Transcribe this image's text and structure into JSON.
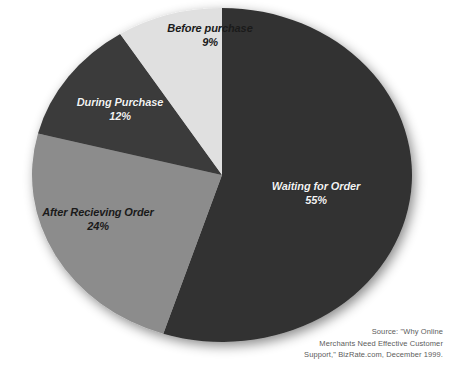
{
  "chart_data": {
    "type": "pie",
    "title": "",
    "subtitle": "",
    "xlabel": "",
    "ylabel": "",
    "legend_position": "none",
    "labels_inside": true,
    "categories": [
      "Waiting for Order",
      "After Recieving Order",
      "During Purchase",
      "Before purchase"
    ],
    "values": [
      55,
      24,
      12,
      9
    ],
    "value_labels": [
      "55%",
      "24%",
      "12%",
      "9%"
    ],
    "units": "percent",
    "total": 100,
    "slices": [
      {
        "name": "Waiting for Order",
        "value": 55,
        "value_label": "55%",
        "color": "#333333",
        "label_color": "#f2f2f2"
      },
      {
        "name": "After Recieving Order",
        "value": 24,
        "value_label": "24%",
        "color": "#8c8c8c",
        "label_color": "#1a1a1a"
      },
      {
        "name": "During Purchase",
        "value": 12,
        "value_label": "12%",
        "color": "#3a3a3a",
        "label_color": "#f2f2f2"
      },
      {
        "name": "Before purchase",
        "value": 9,
        "value_label": "9%",
        "color": "#e0e0e0",
        "label_color": "#1a1a1a"
      }
    ]
  },
  "labels": {
    "before": {
      "name": "Before purchase",
      "value": "9%"
    },
    "during": {
      "name": "During Purchase",
      "value": "12%"
    },
    "after": {
      "name": "After Recieving Order",
      "value": "24%"
    },
    "waiting": {
      "name": "Waiting for Order",
      "value": "55%"
    }
  },
  "source": {
    "line1": "Source: \"Why Online",
    "line2": "Merchants Need Effective Customer",
    "line3": "Support,\" BizRate.com, December 1999."
  },
  "colors": {
    "background": "#ffffff",
    "slice_dark": "#333333",
    "slice_dark_alt": "#3a3a3a",
    "slice_gray": "#8c8c8c",
    "slice_light": "#e0e0e0",
    "source_text": "#5c5c5c"
  }
}
